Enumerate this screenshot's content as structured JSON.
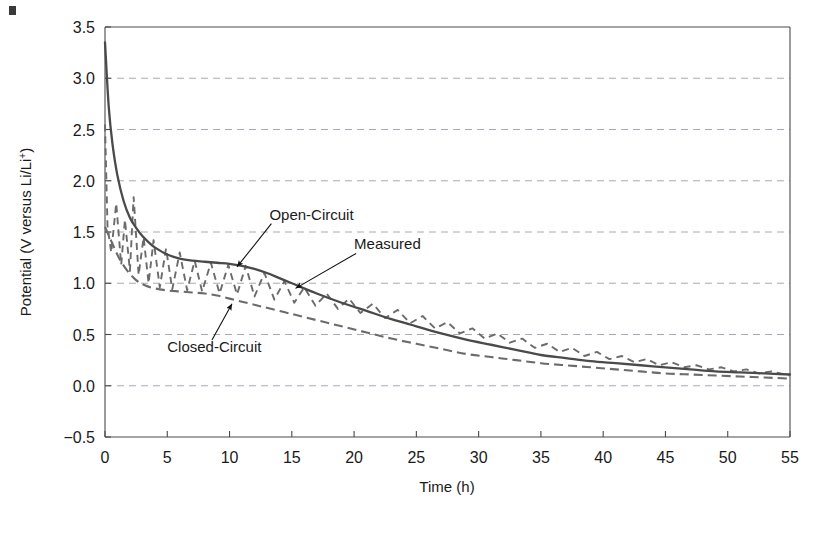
{
  "figure": {
    "background_color": "#ffffff",
    "artifact": "scan-mark"
  },
  "chart_data": {
    "type": "line",
    "title": "",
    "xlabel": "Time (h)",
    "ylabel": "Potential (V versus Li/Li+)",
    "ylabel_prefix": "Potential (V versus Li/Li",
    "ylabel_superscript": "+",
    "ylabel_suffix": ")",
    "xlim": [
      0,
      55
    ],
    "ylim": [
      -0.5,
      3.5
    ],
    "xticks": [
      0,
      5,
      10,
      15,
      20,
      25,
      30,
      35,
      40,
      45,
      50,
      55
    ],
    "xtick_labels": [
      "0",
      "5",
      "10",
      "15",
      "20",
      "25",
      "30",
      "35",
      "40",
      "45",
      "50",
      "55"
    ],
    "yticks": [
      -0.5,
      0.0,
      0.5,
      1.0,
      1.5,
      2.0,
      2.5,
      3.0,
      3.5
    ],
    "ytick_labels": [
      "-0.5",
      "0.0",
      "0.5",
      "1.0",
      "1.5",
      "2.0",
      "2.5",
      "3.0",
      "3.5"
    ],
    "grid": true,
    "grid_axis": "y",
    "grid_style": "dashed",
    "grid_color": "#9aa3ad",
    "legend": "none",
    "annotations": [
      {
        "text": "Open-Circuit",
        "x": 13.2,
        "y": 1.62,
        "points_to_x": 10.6,
        "points_to_y": 1.16
      },
      {
        "text": "Measured",
        "x": 20.0,
        "y": 1.33,
        "points_to_x": 15.3,
        "points_to_y": 0.95
      },
      {
        "text": "Closed-Circuit",
        "x": 5.0,
        "y": 0.33,
        "points_to_x": 10.2,
        "points_to_y": 0.8
      }
    ],
    "series": [
      {
        "name": "Open-Circuit",
        "style": "solid",
        "color": "#4a4a4a",
        "x": [
          0,
          0.3,
          0.6,
          1.0,
          1.5,
          2.0,
          2.5,
          3.0,
          3.5,
          4.0,
          5.0,
          6.0,
          7.0,
          8.0,
          9.0,
          10.0,
          11.0,
          12.0,
          13.0,
          14.0,
          15.0,
          17.0,
          19.0,
          21.0,
          23.0,
          25.0,
          27.0,
          29.0,
          31.0,
          33.0,
          35.0,
          37.0,
          39.0,
          41.0,
          43.0,
          45.0,
          47.0,
          49.0,
          51.0,
          53.0,
          55.0
        ],
        "y": [
          3.35,
          2.72,
          2.36,
          2.05,
          1.8,
          1.64,
          1.54,
          1.46,
          1.4,
          1.35,
          1.28,
          1.24,
          1.22,
          1.21,
          1.2,
          1.19,
          1.17,
          1.14,
          1.1,
          1.05,
          1.0,
          0.9,
          0.81,
          0.73,
          0.65,
          0.58,
          0.51,
          0.45,
          0.4,
          0.35,
          0.3,
          0.27,
          0.24,
          0.22,
          0.2,
          0.18,
          0.16,
          0.14,
          0.13,
          0.12,
          0.11
        ]
      },
      {
        "name": "Closed-Circuit",
        "style": "dashed",
        "color": "#6b6b6b",
        "x": [
          0,
          0.4,
          0.8,
          1.2,
          1.8,
          2.5,
          3.2,
          4.0,
          5.0,
          6.0,
          7.0,
          8.0,
          9.0,
          10.0,
          11.0,
          12.0,
          13.0,
          15.0,
          17.0,
          19.0,
          21.0,
          23.0,
          25.0,
          27.0,
          29.0,
          31.0,
          33.0,
          35.0,
          37.0,
          39.0,
          41.0,
          43.0,
          45.0,
          47.0,
          49.0,
          51.0,
          53.0,
          55.0
        ],
        "y": [
          1.55,
          1.44,
          1.33,
          1.23,
          1.12,
          1.03,
          0.98,
          0.95,
          0.93,
          0.92,
          0.91,
          0.9,
          0.88,
          0.85,
          0.82,
          0.79,
          0.76,
          0.7,
          0.64,
          0.58,
          0.52,
          0.46,
          0.41,
          0.36,
          0.31,
          0.28,
          0.25,
          0.22,
          0.2,
          0.18,
          0.16,
          0.14,
          0.12,
          0.11,
          0.1,
          0.09,
          0.08,
          0.07
        ]
      },
      {
        "name": "Measured",
        "style": "dashed-oscillating",
        "color": "#6b6b6b",
        "description": "Oscillates between the closed-circuit and open-circuit envelopes with period decreasing over time",
        "x": [
          0,
          0.2,
          0.5,
          0.9,
          1.3,
          1.6,
          2.0,
          2.3,
          2.7,
          3.1,
          3.5,
          3.9,
          4.4,
          4.9,
          5.4,
          6.0,
          6.6,
          7.2,
          7.8,
          8.5,
          9.2,
          9.9,
          10.6,
          11.3,
          12.0,
          12.8,
          13.6,
          14.4,
          15.2,
          16.0,
          16.9,
          17.8,
          18.7,
          19.6,
          20.5,
          21.5,
          22.5,
          23.5,
          24.5,
          25.5,
          26.5,
          27.5,
          28.5,
          29.5,
          30.5,
          31.5,
          32.5,
          33.5,
          34.5,
          35.5,
          36.5,
          37.5,
          38.5,
          39.5,
          40.5,
          41.5,
          42.5,
          43.5,
          44.5,
          45.5,
          46.5,
          47.5,
          48.5,
          49.5,
          50.5,
          51.5,
          52.5,
          53.5,
          55.0
        ],
        "y": [
          2.55,
          1.56,
          1.3,
          1.78,
          1.18,
          1.62,
          1.12,
          1.84,
          1.08,
          1.45,
          1.0,
          1.42,
          0.96,
          1.34,
          0.94,
          1.3,
          0.93,
          1.22,
          0.92,
          1.2,
          0.9,
          1.18,
          0.89,
          1.17,
          0.87,
          1.1,
          0.84,
          1.02,
          0.81,
          0.96,
          0.78,
          0.9,
          0.75,
          0.85,
          0.71,
          0.8,
          0.66,
          0.74,
          0.61,
          0.68,
          0.56,
          0.62,
          0.51,
          0.56,
          0.46,
          0.51,
          0.42,
          0.46,
          0.37,
          0.41,
          0.33,
          0.37,
          0.29,
          0.33,
          0.26,
          0.29,
          0.23,
          0.26,
          0.2,
          0.23,
          0.18,
          0.2,
          0.16,
          0.18,
          0.14,
          0.16,
          0.12,
          0.14,
          0.1
        ]
      }
    ]
  }
}
